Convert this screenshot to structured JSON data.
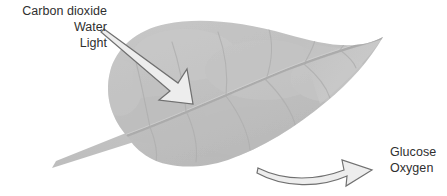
{
  "diagram": {
    "background_color": "#ffffff",
    "text_color": "#2f2f2f",
    "leaf_fill_color": "#c2c2c2",
    "leaf_shadow_color": "#b3b3b3",
    "vein_color": "#a9a9a9",
    "arrow_fill_color": "#e8e8e8",
    "arrow_outline_color": "#7d7d7d"
  },
  "inputs": {
    "label_name": "inputs-label",
    "lines": [
      "Carbon dioxide",
      "Water",
      "Light"
    ],
    "line_1": "Carbon dioxide",
    "line_2": "Water",
    "line_3": "Light"
  },
  "outputs": {
    "label_name": "outputs-label",
    "lines": [
      "Glucose",
      "Oxygen"
    ],
    "line_1": "Glucose",
    "line_2": "Oxygen"
  },
  "shapes": {
    "leaf_blade": "leaf-blade",
    "leaf_stem": "leaf-stem",
    "midrib": "leaf-midrib",
    "lateral_veins": "leaf-lateral-veins",
    "input_arrow": "inputs-arrow",
    "output_arrow": "outputs-arrow"
  }
}
